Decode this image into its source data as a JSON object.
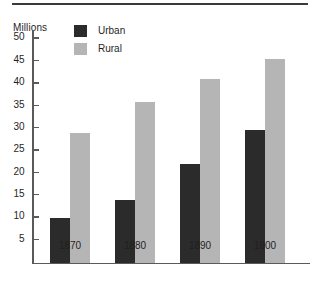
{
  "chart_data": {
    "type": "bar",
    "title": "",
    "subtitle": "",
    "xlabel": "",
    "ylabel": "Millions",
    "categories": [
      "1870",
      "1880",
      "1890",
      "1900"
    ],
    "series": [
      {
        "name": "Urban",
        "color": "#2b2b2b",
        "values": [
          10,
          14,
          22,
          29.7
        ]
      },
      {
        "name": "Rural",
        "color": "#b5b5b5",
        "values": [
          29,
          36,
          41,
          45.5
        ]
      }
    ],
    "ylim": [
      0,
      52
    ],
    "yticks": [
      5,
      10,
      15,
      20,
      25,
      30,
      35,
      40,
      45,
      50
    ],
    "ytick_labels": [
      "5",
      "10",
      "15",
      "20",
      "25",
      "30",
      "35",
      "40",
      "45",
      "50"
    ],
    "grid": false,
    "legend_position": "top-left-inside",
    "axis_color": "#5a5a5a",
    "rule_color": "#3a3a3a",
    "background": "#ffffff"
  },
  "legend": {
    "items": [
      {
        "label": "Urban",
        "swatch": "urban"
      },
      {
        "label": "Rural",
        "swatch": "rural"
      }
    ]
  },
  "axis": {
    "unit_caption": "Millions"
  }
}
